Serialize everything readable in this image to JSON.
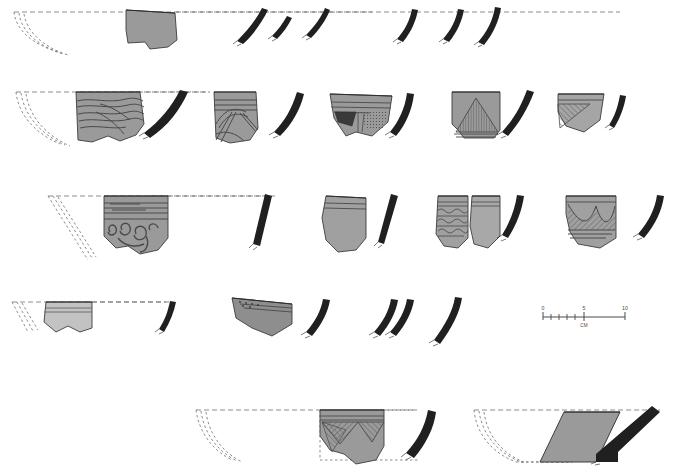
{
  "plate": {
    "title": "Pottery sherd illustration plate",
    "description": "Archaeological line-drawing plate of ceramic rim sherds with reconstructed vessel profiles, shaded body fragments and blacked-out section profiles, arranged in five registers.",
    "background_color": "#ffffff",
    "ink_color": "#1a1a1a",
    "sherd_fill_medium": "#9a9a9a",
    "sherd_fill_light": "#c2c2c2",
    "sherd_fill_dark": "#5a5a5a",
    "sherd_outline": "#3a3a3a",
    "dashed_color": "#6e6e6e",
    "section_black": "#202020"
  },
  "scale_bar": {
    "name": "scale-bar",
    "unit_label": "CM",
    "ticks": [
      "0",
      "5",
      "10"
    ],
    "minor_tick_count": 9,
    "total_cm": 10,
    "x": 543,
    "y": 317,
    "length_px": 82
  },
  "rows": [
    {
      "id": "row-1",
      "label": "Register 1",
      "items": [
        {
          "type": "profile-reconstruction",
          "name": "vessel-profile-1",
          "decoration": "none",
          "note": "dashed reconstructed rim arc"
        },
        {
          "type": "sherd",
          "name": "sherd-1-1",
          "fill": "#9a9a9a",
          "decoration": "plain",
          "shape": "angular-body-fragment"
        },
        {
          "type": "section",
          "name": "rim-section-1-1",
          "curve": "everted-curved"
        },
        {
          "type": "section",
          "name": "rim-section-1-2",
          "curve": "short-oblique"
        },
        {
          "type": "section",
          "name": "rim-section-1-3",
          "curve": "short-oblique"
        },
        {
          "type": "section",
          "name": "rim-section-1-4",
          "curve": "curved-tapering"
        },
        {
          "type": "section",
          "name": "rim-section-1-5",
          "curve": "curved-tapering"
        },
        {
          "type": "section",
          "name": "rim-section-1-6",
          "curve": "straight-oblique"
        }
      ]
    },
    {
      "id": "row-2",
      "label": "Register 2",
      "items": [
        {
          "type": "profile-reconstruction",
          "name": "vessel-profile-2",
          "decoration": "none"
        },
        {
          "type": "sherd",
          "name": "sherd-2-1",
          "fill": "#9a9a9a",
          "decoration": "incised-wavy-lines"
        },
        {
          "type": "section",
          "name": "rim-section-2-1",
          "curve": "long-curved"
        },
        {
          "type": "sherd",
          "name": "sherd-2-2",
          "fill": "#9a9a9a",
          "decoration": "incised-double-line-chevrons-with-bands"
        },
        {
          "type": "section",
          "name": "rim-section-2-2",
          "curve": "curved"
        },
        {
          "type": "sherd",
          "name": "sherd-2-3",
          "fill": "#9a9a9a",
          "decoration": "burnished-panel-and-stipple"
        },
        {
          "type": "section",
          "name": "rim-section-2-3",
          "curve": "curved"
        },
        {
          "type": "sherd",
          "name": "sherd-2-4",
          "fill": "#9a9a9a",
          "decoration": "hatched-triangle"
        },
        {
          "type": "section",
          "name": "rim-section-2-4",
          "curve": "straight-oblique"
        },
        {
          "type": "sherd",
          "name": "sherd-2-5",
          "fill": "#a5a5a5",
          "decoration": "hatched-corner-triangle"
        },
        {
          "type": "section",
          "name": "rim-section-2-5",
          "curve": "short-straight"
        }
      ]
    },
    {
      "id": "row-3",
      "label": "Register 3",
      "items": [
        {
          "type": "profile-reconstruction",
          "name": "vessel-profile-3",
          "decoration": "none"
        },
        {
          "type": "sherd",
          "name": "sherd-3-1",
          "fill": "#9a9a9a",
          "decoration": "horizontal-bands-with-spiral-scrolls"
        },
        {
          "type": "section",
          "name": "rim-section-3-1",
          "curve": "straight-oblique-thick"
        },
        {
          "type": "sherd",
          "name": "sherd-3-2",
          "fill": "#a0a0a0",
          "decoration": "plain-with-rim-bands"
        },
        {
          "type": "section",
          "name": "rim-section-3-2",
          "curve": "straight-oblique-thick"
        },
        {
          "type": "sherd",
          "name": "sherd-3-3",
          "fill": "#a0a0a0",
          "decoration": "wavy-zigzag-bands"
        },
        {
          "type": "sherd",
          "name": "sherd-3-4",
          "fill": "#a8a8a8",
          "decoration": "plain-with-rim-bands"
        },
        {
          "type": "section",
          "name": "rim-section-3-3",
          "curve": "short-curved"
        },
        {
          "type": "sherd",
          "name": "sherd-3-5",
          "fill": "#a0a0a0",
          "decoration": "hanging-hatched-festoons"
        },
        {
          "type": "section",
          "name": "rim-section-3-4",
          "curve": "curved"
        }
      ]
    },
    {
      "id": "row-4",
      "label": "Register 4",
      "items": [
        {
          "type": "profile-reconstruction",
          "name": "vessel-profile-4",
          "decoration": "none"
        },
        {
          "type": "sherd",
          "name": "sherd-4-1",
          "fill": "#c2c2c2",
          "decoration": "plain-with-rim-bands"
        },
        {
          "type": "section",
          "name": "rim-section-4-1",
          "curve": "tapering-curved"
        },
        {
          "type": "sherd",
          "name": "sherd-4-2",
          "fill": "#8e8e8e",
          "decoration": "stippled-band-tapering-profile"
        },
        {
          "type": "section",
          "name": "rim-section-4-2",
          "curve": "curved"
        },
        {
          "type": "section",
          "name": "rim-section-4-3",
          "curve": "curved"
        },
        {
          "type": "section",
          "name": "rim-section-4-4",
          "curve": "curved"
        },
        {
          "type": "section",
          "name": "rim-section-4-5",
          "curve": "curved-long"
        }
      ]
    },
    {
      "id": "row-5",
      "label": "Register 5",
      "items": [
        {
          "type": "profile-reconstruction",
          "name": "vessel-profile-5",
          "decoration": "none"
        },
        {
          "type": "sherd",
          "name": "sherd-5-1",
          "fill": "#9a9a9a",
          "decoration": "hatched-pendant-triangles"
        },
        {
          "type": "section",
          "name": "rim-section-5-1",
          "curve": "thick-curved"
        },
        {
          "type": "profile-reconstruction",
          "name": "vessel-profile-6",
          "decoration": "none"
        },
        {
          "type": "sherd",
          "name": "sherd-5-2",
          "fill": "#9a9a9a",
          "decoration": "plain-parallelogram"
        },
        {
          "type": "section",
          "name": "rim-section-5-2",
          "curve": "angular-carinated"
        }
      ]
    }
  ]
}
